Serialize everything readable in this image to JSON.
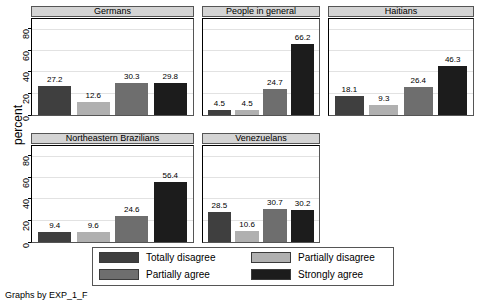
{
  "chart_data": {
    "type": "bar",
    "title": "",
    "xlabel": "",
    "ylabel": "percent",
    "ylim": [
      0,
      90
    ],
    "yticks": [
      0,
      20,
      40,
      60,
      80
    ],
    "grid": true,
    "legend_position": "bottom-center",
    "categories": [
      "Totally disagree",
      "Partially disagree",
      "Partially agree",
      "Strongly agree"
    ],
    "panels": [
      {
        "name": "Germans",
        "values": [
          27.2,
          12.6,
          30.3,
          29.8
        ]
      },
      {
        "name": "People in general",
        "values": [
          4.5,
          4.5,
          24.7,
          66.2
        ]
      },
      {
        "name": "Haitians",
        "values": [
          18.1,
          9.3,
          26.4,
          46.3
        ]
      },
      {
        "name": "Northeastern Brazilians",
        "values": [
          9.4,
          9.6,
          24.6,
          56.4
        ]
      },
      {
        "name": "Venezuelans",
        "values": [
          28.5,
          10.6,
          30.7,
          30.2
        ]
      }
    ],
    "series_colors": [
      "#3f3f3f",
      "#b0b0b0",
      "#6e6e6e",
      "#1c1c1c"
    ]
  },
  "legend": {
    "items": [
      {
        "label": "Totally disagree",
        "color": "#3f3f3f"
      },
      {
        "label": "Partially disagree",
        "color": "#b0b0b0"
      },
      {
        "label": "Partially agree",
        "color": "#6e6e6e"
      },
      {
        "label": "Strongly agree",
        "color": "#1c1c1c"
      }
    ]
  },
  "caption": "Graphs by EXP_1_F"
}
